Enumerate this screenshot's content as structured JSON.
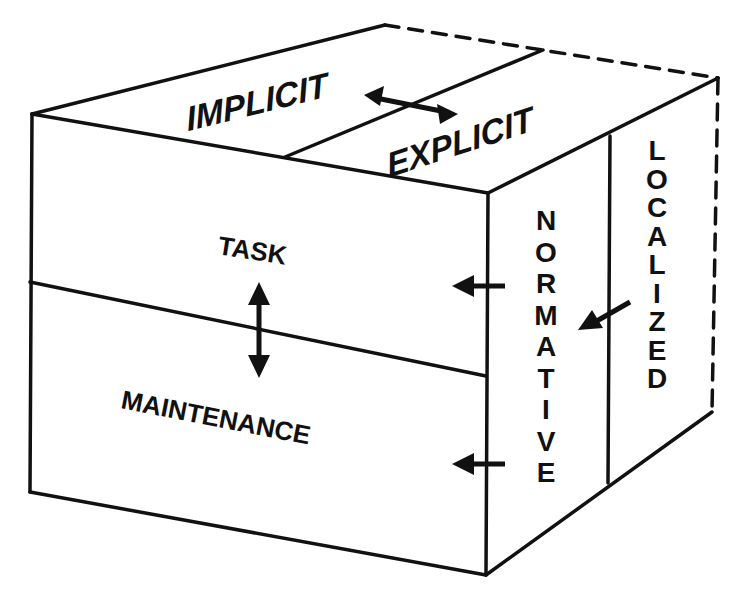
{
  "diagram": {
    "top_face": {
      "left_label": "IMPLICIT",
      "right_label": "EXPLICIT"
    },
    "front_face": {
      "upper_label": "TASK",
      "lower_label": "MAINTENANCE"
    },
    "side_face": {
      "inner_label": "NORMATIVE",
      "outer_label": "LOCALIZED"
    },
    "ink_color": "#111111",
    "background": "#ffffff"
  }
}
